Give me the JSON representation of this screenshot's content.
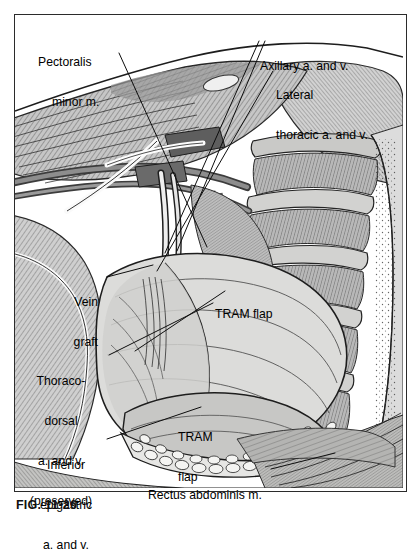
{
  "figure": {
    "caption": "FIG. 11-26",
    "style": "grayscale pen-and-ink anatomical line drawing with hatching",
    "frame": {
      "border_color": "#2b2b2b",
      "background": "#ffffff"
    }
  },
  "labels": [
    {
      "id": "pectoralis-minor",
      "lines": [
        "Pectoralis",
        "minor m."
      ],
      "align": "left",
      "x": 38,
      "y": 30,
      "leader": {
        "from": [
          117,
          50
        ],
        "to": [
          205,
          246
        ]
      }
    },
    {
      "id": "axillary-vessels",
      "lines": [
        "Axillary a. and v."
      ],
      "align": "left",
      "x": 260,
      "y": 33,
      "leader": {
        "from": [
          256,
          40
        ],
        "to": [
          160,
          250
        ]
      }
    },
    {
      "id": "lateral-thoracic-vessels",
      "lines": [
        "Lateral",
        "thoracic a. and v."
      ],
      "align": "left",
      "x": 276,
      "y": 62,
      "leader": {
        "from": [
          272,
          70
        ],
        "to": [
          152,
          268
        ]
      }
    },
    {
      "id": "vein-graft",
      "lines": [
        "Vein",
        "graft"
      ],
      "align": "right",
      "x": 48,
      "y": 269,
      "leader": {
        "from": [
          104,
          275
        ],
        "to": [
          150,
          262
        ]
      }
    },
    {
      "id": "tram-flap-upper",
      "lines": [
        "TRAM flap"
      ],
      "align": "left",
      "x": 215,
      "y": 281,
      "leader": null
    },
    {
      "id": "thoracodorsal-vessels",
      "lines": [
        "Thoraco-",
        "dorsal",
        "a. and v.",
        "(preserved)"
      ],
      "align": "center",
      "x": 22,
      "y": 348,
      "leader": {
        "from": [
          106,
          352
        ],
        "to": [
          210,
          300
        ]
      }
    },
    {
      "id": "tram-flap-lower",
      "lines": [
        "TRAM",
        "flap"
      ],
      "align": "left",
      "x": 178,
      "y": 404,
      "leader": null
    },
    {
      "id": "inferior-epigastric-vessels",
      "lines": [
        "Inferior",
        "epigastric",
        "a. and v."
      ],
      "align": "center",
      "x": 35,
      "y": 432,
      "leader": {
        "from": [
          104,
          437
        ],
        "to": [
          196,
          404
        ]
      }
    },
    {
      "id": "rectus-abdominis",
      "lines": [
        "Rectus abdominis m."
      ],
      "align": "left",
      "x": 148,
      "y": 463,
      "leader": {
        "from": [
          268,
          466
        ],
        "to": [
          330,
          450
        ]
      }
    }
  ],
  "structures": [
    "chest wall with pectoralis major and minor muscles",
    "axillary artery and vein",
    "lateral thoracic artery and vein",
    "thoracodorsal artery and vein (preserved)",
    "interposition vein graft",
    "rib cage with intercostal muscles",
    "TRAM flap (transverse rectus abdominis myocutaneous flap)",
    "rectus abdominis muscle",
    "inferior epigastric artery and vein",
    "subcutaneous fat layer at flap margin"
  ],
  "palette": {
    "ink": "#1a1a1a",
    "line": "#2b2b2b",
    "muscle_light": "#d6d6d6",
    "muscle_mid": "#b4b4b4",
    "muscle_dark": "#8a8a8a",
    "vessel_dark": "#6e6e6e",
    "vessel_light": "#f2f2f2",
    "flap_fill": "#dcdcda",
    "rib_fill": "#c9c9c7",
    "background": "#ffffff"
  }
}
